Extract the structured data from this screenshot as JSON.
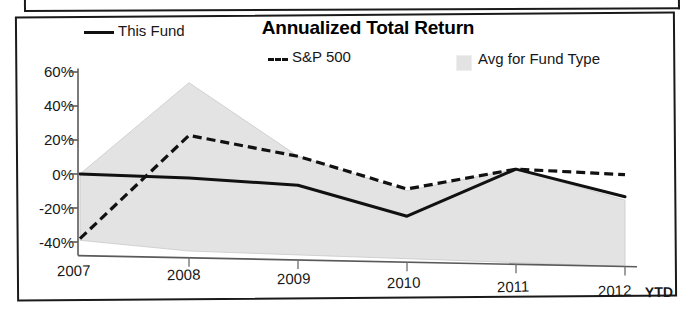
{
  "chart_data": {
    "type": "line",
    "title": "Annualized Total Return",
    "xlabel": "",
    "ylabel": "",
    "categories": [
      "2007",
      "2008",
      "2009",
      "2010",
      "2011",
      "2012"
    ],
    "last_category_note": "YTD",
    "ytick_labels": [
      "60%",
      "40%",
      "20%",
      "0%",
      "-20%",
      "-40%"
    ],
    "ytick_values": [
      60,
      40,
      20,
      0,
      -20,
      -40
    ],
    "ylim": [
      -48,
      62
    ],
    "grid": false,
    "legend_position": "top",
    "series": [
      {
        "name": "This Fund",
        "style": "solid",
        "color": "#111111",
        "values": [
          0,
          -1,
          -4,
          -21,
          8,
          -7
        ]
      },
      {
        "name": "S&P 500",
        "style": "dashed",
        "color": "#111111",
        "values": [
          -38,
          24,
          13,
          -5,
          8,
          6
        ]
      },
      {
        "name": "Avg for Fund Type",
        "style": "band",
        "color": "#e3e3e3",
        "upper": [
          0,
          55,
          13,
          -6,
          8,
          -9
        ],
        "lower": [
          -39,
          -44,
          -45,
          -46,
          -47,
          -48
        ]
      }
    ],
    "legend": [
      {
        "label": "This Fund",
        "swatch": "solid-line"
      },
      {
        "label": "S&P 500",
        "swatch": "dashed-line"
      },
      {
        "label": "Avg for Fund Type",
        "swatch": "gray-square"
      }
    ]
  },
  "colors": {
    "line": "#111111",
    "band": "#e3e3e3",
    "axis": "#555555",
    "frame": "#1a1a1a"
  }
}
